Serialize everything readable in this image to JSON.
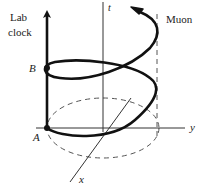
{
  "diagram": {
    "labels": {
      "lab_clock_line1": "Lab",
      "lab_clock_line2": "clock",
      "muon": "Muon",
      "t_axis": "t",
      "x_axis": "x",
      "y_axis": "y",
      "event_a": "A",
      "event_b": "B"
    },
    "colors": {
      "worldline": "#111111",
      "axes": "#333333",
      "dashed": "#555555",
      "text": "#222222"
    }
  }
}
